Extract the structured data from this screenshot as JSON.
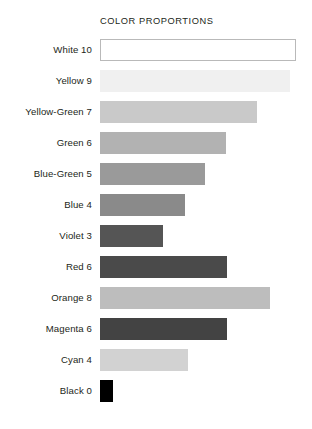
{
  "chart": {
    "title": "COLOR PROPORTIONS"
  },
  "chart_data": {
    "type": "bar",
    "orientation": "horizontal",
    "title": "COLOR PROPORTIONS",
    "xlabel": "",
    "ylabel": "",
    "grid": false,
    "legend": false,
    "axis_visible": false,
    "tick_labels_visible": false,
    "xlim": [
      0,
      10
    ],
    "categories": [
      "White 10",
      "Yellow 9",
      "Yellow-Green 7",
      "Green 6",
      "Blue-Green 5",
      "Blue 4",
      "Violet 3",
      "Red 6",
      "Orange 8",
      "Magenta 6",
      "Cyan 4",
      "Black 0"
    ],
    "color_names": [
      "White",
      "Yellow",
      "Yellow-Green",
      "Green",
      "Blue-Green",
      "Blue",
      "Violet",
      "Red",
      "Orange",
      "Magenta",
      "Cyan",
      "Black"
    ],
    "values": [
      10,
      9,
      7,
      6,
      5,
      4,
      3,
      6,
      8,
      6,
      4,
      0
    ],
    "bar_pixel_lengths": [
      196,
      190,
      157,
      126,
      105,
      85,
      63,
      127,
      170,
      127,
      88,
      13
    ],
    "bar_fill_colors": [
      "#ffffff",
      "#f0f0f0",
      "#c9c9c9",
      "#b2b2b2",
      "#9a9a9a",
      "#8a8a8a",
      "#555555",
      "#4a4a4a",
      "#bdbdbd",
      "#434343",
      "#d2d2d2",
      "#000000"
    ],
    "bar_outline_colors": [
      "#b9b9b9",
      "none",
      "none",
      "none",
      "none",
      "none",
      "none",
      "none",
      "none",
      "none",
      "none",
      "none"
    ]
  },
  "bars": [
    {
      "label": "White 10",
      "value": 10,
      "length": 196,
      "fill": "#ffffff",
      "outlined": true
    },
    {
      "label": "Yellow 9",
      "value": 9,
      "length": 190,
      "fill": "#f0f0f0",
      "outlined": false
    },
    {
      "label": "Yellow-Green 7",
      "value": 7,
      "length": 157,
      "fill": "#c9c9c9",
      "outlined": false
    },
    {
      "label": "Green 6",
      "value": 6,
      "length": 126,
      "fill": "#b2b2b2",
      "outlined": false
    },
    {
      "label": "Blue-Green 5",
      "value": 5,
      "length": 105,
      "fill": "#9a9a9a",
      "outlined": false
    },
    {
      "label": "Blue 4",
      "value": 4,
      "length": 85,
      "fill": "#8a8a8a",
      "outlined": false
    },
    {
      "label": "Violet 3",
      "value": 3,
      "length": 63,
      "fill": "#555555",
      "outlined": false
    },
    {
      "label": "Red 6",
      "value": 6,
      "length": 127,
      "fill": "#4a4a4a",
      "outlined": false
    },
    {
      "label": "Orange 8",
      "value": 8,
      "length": 170,
      "fill": "#bdbdbd",
      "outlined": false
    },
    {
      "label": "Magenta 6",
      "value": 6,
      "length": 127,
      "fill": "#434343",
      "outlined": false
    },
    {
      "label": "Cyan 4",
      "value": 4,
      "length": 88,
      "fill": "#d2d2d2",
      "outlined": false
    },
    {
      "label": "Black 0",
      "value": 0,
      "length": 13,
      "fill": "#000000",
      "outlined": false
    }
  ]
}
